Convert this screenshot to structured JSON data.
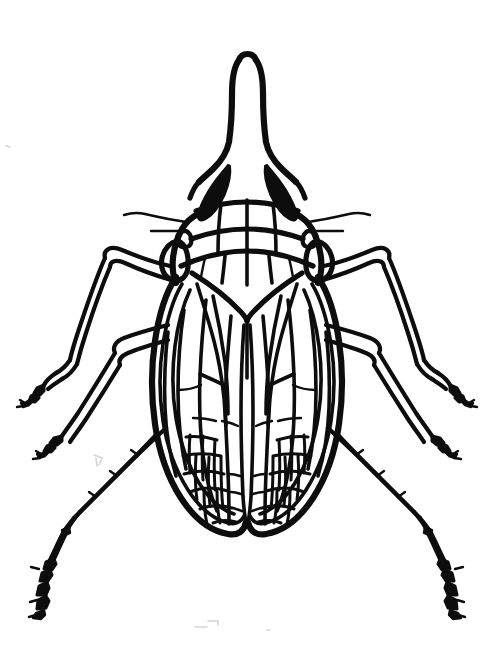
{
  "image": {
    "kind": "line-drawing",
    "subject": "insect-dorsal-view",
    "common_name": "treehopper",
    "view": "dorsal",
    "medium": "black ink line drawing",
    "background_color": "#ffffff",
    "ink_color": "#0d0d0d",
    "canvas": {
      "width": 487,
      "height": 652
    },
    "visible_text": [],
    "labels": [],
    "caption": ""
  },
  "anatomy": {
    "head": {
      "name": "head-with-elongated-snout",
      "description": "long tapering upward-pointing process (pronotal horn / snout) with rounded tip",
      "tip_y": 57,
      "base_y": 175,
      "center_x": 247
    },
    "eyes": {
      "name": "compound-eyes",
      "count": 2,
      "fill": "#0d0d0d",
      "left_center": [
        211,
        182
      ],
      "right_center": [
        283,
        182
      ]
    },
    "ocelli": {
      "name": "ocelli",
      "count": 2,
      "left_center": [
        185,
        237
      ],
      "right_center": [
        309,
        237
      ]
    },
    "antennae": {
      "name": "antennae",
      "count": 2,
      "description": "thin short filaments projecting laterally from below each eye"
    },
    "pronotum": {
      "name": "pronotum",
      "description": "segmented plate behind head with vertical and transverse ridge lines",
      "segment_lines": 4
    },
    "scutellum": {
      "name": "scutellum",
      "description": "V-shaped plate at the base of the wings"
    },
    "wings": {
      "name": "forewings",
      "count": 2,
      "description": "two large overlapping elytra-like forewings covering the abdomen, with longitudinal veins and reticulated apical cells",
      "longitudinal_veins_per_wing": 6,
      "apical_cell_network": true
    },
    "legs": {
      "name": "legs",
      "count": 6,
      "pairs": [
        {
          "id": "foreleg",
          "label": "fore legs",
          "direction": "upward-outward",
          "tarsus": "claw"
        },
        {
          "id": "midleg",
          "label": "middle legs",
          "direction": "outward",
          "tarsus": "claw"
        },
        {
          "id": "hindleg",
          "label": "hind legs",
          "direction": "downward-outward",
          "tarsus": "claw",
          "note": "longest pair, with spine rows"
        }
      ]
    }
  }
}
